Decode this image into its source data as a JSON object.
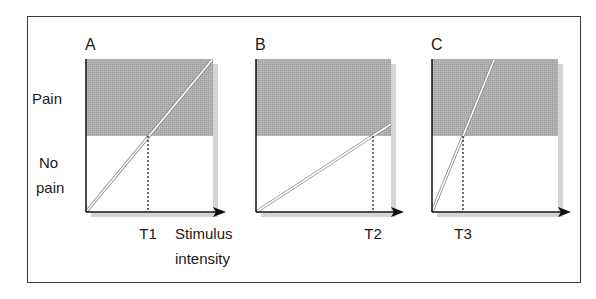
{
  "figure": {
    "y_labels": {
      "pain": "Pain",
      "no_pain_line1": "No",
      "no_pain_line2": "pain"
    },
    "x_label": {
      "line1": "Stimulus",
      "line2": "intensity"
    },
    "colors": {
      "pain_region": "#a9a9a9",
      "shadow": "#d4d4d4",
      "axis": "#111111",
      "frame": "#3a3a3a"
    },
    "panels": [
      {
        "id": "A",
        "label": "A",
        "threshold_label": "T1",
        "x0": 86,
        "x_shade_end": 213,
        "x_arrow_tip": 226,
        "x_threshold": 148,
        "line_end_x": 212,
        "line_end_y": 60
      },
      {
        "id": "B",
        "label": "B",
        "threshold_label": "T2",
        "x0": 256,
        "x_shade_end": 391,
        "x_arrow_tip": 404,
        "x_threshold": 373,
        "line_end_x": 391,
        "line_end_y": 124
      },
      {
        "id": "C",
        "label": "C",
        "threshold_label": "T3",
        "x0": 432,
        "x_shade_end": 558,
        "x_arrow_tip": 571,
        "x_threshold": 463,
        "line_end_x": 494,
        "line_end_y": 60
      }
    ],
    "layout": {
      "top": 59,
      "threshold_y": 136,
      "axis_y": 212
    }
  }
}
